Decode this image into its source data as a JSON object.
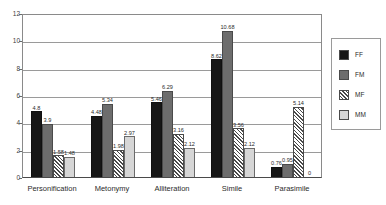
{
  "chart_data": {
    "type": "bar",
    "title": "",
    "subtitle": "",
    "xlabel": "",
    "ylabel": "",
    "ylim": [
      0,
      12
    ],
    "ytick_step": 2,
    "yticks": [
      0,
      2,
      4,
      6,
      8,
      10,
      12
    ],
    "ytick_labels": [
      "0",
      "2",
      "4",
      "6",
      "8",
      "10",
      "12"
    ],
    "grid": true,
    "grid_axis": "y",
    "legend_position": "right",
    "categories": [
      "Personification",
      "Metonymy",
      "Alliteration",
      "Simile",
      "Parasimile"
    ],
    "series": [
      {
        "name": "FF",
        "color": "#171717",
        "pattern": "solid",
        "values": [
          4.8,
          4.48,
          5.46,
          8.62,
          0.76
        ],
        "labels": [
          "4.8",
          "4.48",
          "5.46",
          "8.62",
          "0.76"
        ]
      },
      {
        "name": "FM",
        "color": "#6d6d6d",
        "pattern": "solid",
        "values": [
          3.9,
          5.34,
          6.29,
          10.68,
          0.95
        ],
        "labels": [
          "3.9",
          "5.34",
          "6.29",
          "10.68",
          "0.95"
        ]
      },
      {
        "name": "MF",
        "color": "#ffffff",
        "pattern": "diagonal-hatch",
        "values": [
          1.58,
          1.98,
          3.16,
          3.56,
          5.14
        ],
        "labels": [
          "1.58",
          "1.98",
          "3.16",
          "3.56",
          "5.14"
        ]
      },
      {
        "name": "MM",
        "color": "#d6d6d6",
        "pattern": "solid",
        "values": [
          1.48,
          2.97,
          2.12,
          2.12,
          0
        ],
        "labels": [
          "1.48",
          "2.97",
          "2.12",
          "2.12",
          "0"
        ]
      }
    ]
  },
  "legend": {
    "items": [
      {
        "label": "FF",
        "swatch": "s-FF"
      },
      {
        "label": "FM",
        "swatch": "s-FM"
      },
      {
        "label": "MF",
        "swatch": "s-MF"
      },
      {
        "label": "MM",
        "swatch": "s-MM"
      }
    ]
  },
  "top_clip": {
    "text": ""
  }
}
